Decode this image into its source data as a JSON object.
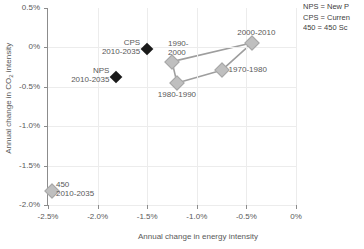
{
  "chart_data": {
    "type": "scatter",
    "title": "",
    "xlabel": "Annual change in energy intensity",
    "ylabel_prefix": "Annual change in CO",
    "ylabel_sub": "2",
    "ylabel_suffix": " intensity",
    "xlim": [
      -2.5,
      0
    ],
    "ylim": [
      -2.0,
      0.5
    ],
    "xticks": [
      "-2.5%",
      "-2.0%",
      "-1.5%",
      "-1.0%",
      "-0.5%",
      "0%"
    ],
    "xtick_values": [
      -2.5,
      -2.0,
      -1.5,
      -1.0,
      -0.5,
      0
    ],
    "yticks": [
      "0.5%",
      "0%",
      "-0.5%",
      "-1.0%",
      "-1.5%",
      "-2.0%"
    ],
    "ytick_values": [
      0.5,
      0,
      -0.5,
      -1.0,
      -1.5,
      -2.0
    ],
    "grid": true,
    "legend_position": "outside-top-right",
    "series": [
      {
        "name": "Historical decades",
        "marker": "diamond",
        "marker_color": "#bfbfbf",
        "connected": true,
        "points": [
          {
            "label_line1": "1970-1980",
            "label_line2": "",
            "x": -0.75,
            "y": -0.29,
            "label_pos": "right"
          },
          {
            "label_line1": "1980-1990",
            "label_line2": "",
            "x": -1.2,
            "y": -0.45,
            "label_pos": "below"
          },
          {
            "label_line1": "1990-",
            "label_line2": "2000",
            "x": -1.25,
            "y": -0.18,
            "label_pos": "above-left"
          },
          {
            "label_line1": "2000-2010",
            "label_line2": "",
            "x": -0.44,
            "y": 0.06,
            "label_pos": "above"
          }
        ]
      },
      {
        "name": "Scenarios",
        "marker": "diamond",
        "marker_color": "#1a1a1a",
        "connected": false,
        "points": [
          {
            "label_line1": "CPS",
            "label_line2": "2010-2035",
            "x": -1.5,
            "y": -0.02,
            "label_pos": "left"
          },
          {
            "label_line1": "NPS",
            "label_line2": "2010-2035",
            "x": -1.81,
            "y": -0.37,
            "label_pos": "left"
          }
        ]
      },
      {
        "name": "450 Scenario",
        "marker": "diamond",
        "marker_color": "#bfbfbf",
        "connected": false,
        "points": [
          {
            "label_line1": "450",
            "label_line2": "2010-2035",
            "x": -2.46,
            "y": -1.82,
            "label_pos": "right"
          }
        ]
      }
    ]
  },
  "legend": {
    "lines": [
      "NPS = New P",
      "CPS = Curren",
      "450 = 450 Sc"
    ]
  }
}
